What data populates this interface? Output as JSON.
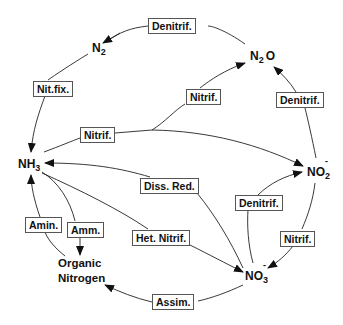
{
  "diagram": {
    "line_color": "#222222",
    "nodes": {
      "n2": {
        "base": "N",
        "sub": "2",
        "sup": ""
      },
      "n2o": {
        "base": "N",
        "sub": "2",
        "tail": "O"
      },
      "nh3": {
        "base": "NH",
        "sub": "3"
      },
      "no2": {
        "base": "NO",
        "sub": "2",
        "sup": "-"
      },
      "no3": {
        "base": "NO",
        "sub": "3",
        "sup": "-"
      },
      "organic": {
        "line1": "Organic",
        "line2": "Nitrogen"
      }
    },
    "processes": {
      "denitrif_top": {
        "label": "Denitrif.",
        "from": "N2O",
        "to": "N2"
      },
      "nit_fix": {
        "label": "Nit.fix.",
        "from": "N2",
        "to": "NH3"
      },
      "nitrif_n2o": {
        "label": "Nitrif.",
        "from": "NH3",
        "to": "N2O"
      },
      "nitrif_nh3": {
        "label": "Nitrif.",
        "from": "NH3",
        "to": "NO2-"
      },
      "denitrif_right": {
        "label": "Denitrif.",
        "from": "NO2-",
        "to": "N2O"
      },
      "diss_red": {
        "label": "Diss.  Red.",
        "from": "NO3-",
        "to": "NH3"
      },
      "denitrif_mid": {
        "label": "Denitrif.",
        "from": "NO3-",
        "to": "NO2-"
      },
      "het_nitrif": {
        "label": "Het.  Nitrif.",
        "from": "NH3",
        "to": "NO3-"
      },
      "nitrif_lower": {
        "label": "Nitrif.",
        "from": "NO2-",
        "to": "NO3-"
      },
      "amin": {
        "label": "Amin.",
        "from": "Organic Nitrogen",
        "to": "NH3"
      },
      "amm": {
        "label": "Amm.",
        "from": "NH3",
        "to": "Organic Nitrogen"
      },
      "assim": {
        "label": "Assim.",
        "from": "NO3-",
        "to": "Organic Nitrogen"
      }
    }
  }
}
